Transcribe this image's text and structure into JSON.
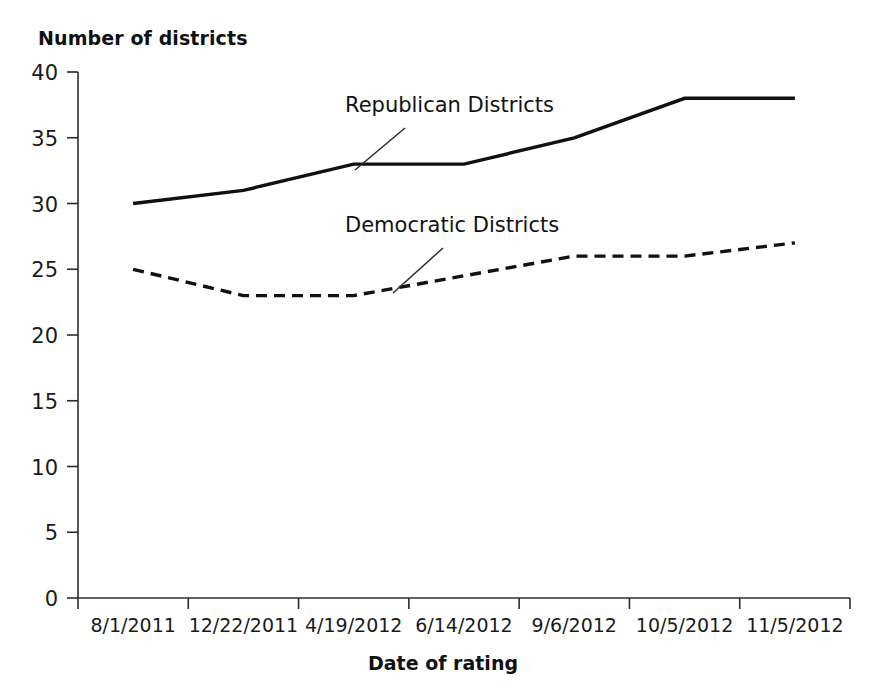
{
  "chart_data": {
    "type": "line",
    "title": "",
    "ylabel": "Number of districts",
    "xlabel": "Date of rating",
    "categories": [
      "8/1/2011",
      "12/22/2011",
      "4/19/2012",
      "6/14/2012",
      "9/6/2012",
      "10/5/2012",
      "11/5/2012"
    ],
    "ylim": [
      0,
      40
    ],
    "yticks": [
      0,
      5,
      10,
      15,
      20,
      25,
      30,
      35,
      40
    ],
    "grid": false,
    "legend_position": "inline-annotation",
    "series": [
      {
        "name": "Republican Districts",
        "style": "solid",
        "color": "#111111",
        "values": [
          30,
          31,
          33,
          33,
          35,
          38,
          38
        ]
      },
      {
        "name": "Democratic Districts",
        "style": "dashed",
        "color": "#111111",
        "values": [
          25,
          23,
          23,
          24.5,
          26,
          26,
          27
        ]
      }
    ],
    "annotations": [
      {
        "text": "Republican Districts",
        "series": "Republican Districts"
      },
      {
        "text": "Democratic Districts",
        "series": "Democratic Districts"
      }
    ]
  }
}
